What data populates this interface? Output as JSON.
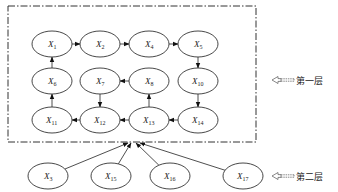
{
  "diagram": {
    "layers": [
      {
        "id": "layer1",
        "label": "第一层"
      },
      {
        "id": "layer2",
        "label": "第二层"
      }
    ],
    "nodes": [
      {
        "id": "X1",
        "base": "X",
        "sub": "1",
        "layer": "layer1",
        "row": 0,
        "col": 0
      },
      {
        "id": "X2",
        "base": "X",
        "sub": "2",
        "layer": "layer1",
        "row": 0,
        "col": 1
      },
      {
        "id": "X4",
        "base": "X",
        "sub": "4",
        "layer": "layer1",
        "row": 0,
        "col": 2
      },
      {
        "id": "X5",
        "base": "X",
        "sub": "5",
        "layer": "layer1",
        "row": 0,
        "col": 3
      },
      {
        "id": "X6",
        "base": "X",
        "sub": "6",
        "layer": "layer1",
        "row": 1,
        "col": 0
      },
      {
        "id": "X7",
        "base": "X",
        "sub": "7",
        "layer": "layer1",
        "row": 1,
        "col": 1
      },
      {
        "id": "X8",
        "base": "X",
        "sub": "8",
        "layer": "layer1",
        "row": 1,
        "col": 2
      },
      {
        "id": "X10",
        "base": "X",
        "sub": "10",
        "layer": "layer1",
        "row": 1,
        "col": 3
      },
      {
        "id": "X11",
        "base": "X",
        "sub": "11",
        "layer": "layer1",
        "row": 2,
        "col": 0
      },
      {
        "id": "X12",
        "base": "X",
        "sub": "12",
        "layer": "layer1",
        "row": 2,
        "col": 1
      },
      {
        "id": "X13",
        "base": "X",
        "sub": "13",
        "layer": "layer1",
        "row": 2,
        "col": 2
      },
      {
        "id": "X14",
        "base": "X",
        "sub": "14",
        "layer": "layer1",
        "row": 2,
        "col": 3
      },
      {
        "id": "X3",
        "base": "X",
        "sub": "3",
        "layer": "layer2",
        "row": 3,
        "col": 0
      },
      {
        "id": "X15",
        "base": "X",
        "sub": "15",
        "layer": "layer2",
        "row": 3,
        "col": 1
      },
      {
        "id": "X16",
        "base": "X",
        "sub": "16",
        "layer": "layer2",
        "row": 3,
        "col": 2
      },
      {
        "id": "X17",
        "base": "X",
        "sub": "17",
        "layer": "layer2",
        "row": 3,
        "col": 3
      }
    ],
    "edges": [
      {
        "from": "X1",
        "to": "X2"
      },
      {
        "from": "X2",
        "to": "X4"
      },
      {
        "from": "X4",
        "to": "X5"
      },
      {
        "from": "X5",
        "to": "X10"
      },
      {
        "from": "X10",
        "to": "X14"
      },
      {
        "from": "X14",
        "to": "X13"
      },
      {
        "from": "X13",
        "to": "X12"
      },
      {
        "from": "X12",
        "to": "X11"
      },
      {
        "from": "X11",
        "to": "X6"
      },
      {
        "from": "X6",
        "to": "X1"
      },
      {
        "from": "X8",
        "to": "X7"
      },
      {
        "from": "X7",
        "to": "X12"
      },
      {
        "from": "X13",
        "to": "X8"
      }
    ],
    "layer_inputs": [
      {
        "from": "X3",
        "to": "layer1"
      },
      {
        "from": "X15",
        "to": "layer1"
      },
      {
        "from": "X16",
        "to": "layer1"
      },
      {
        "from": "X17",
        "to": "layer1"
      }
    ]
  }
}
